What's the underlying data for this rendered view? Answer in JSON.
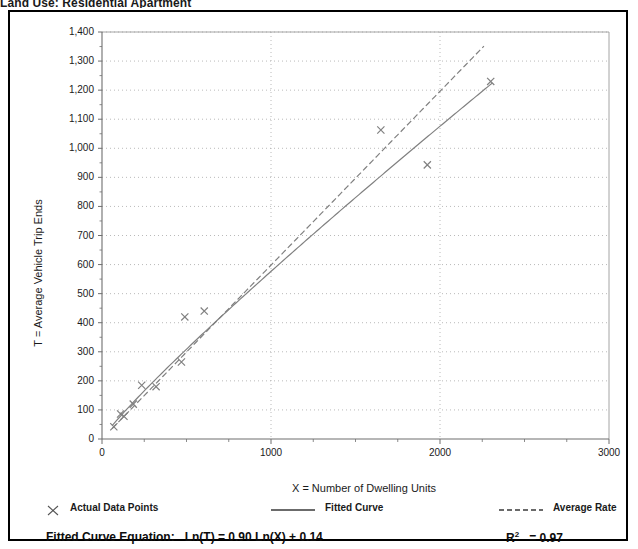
{
  "page": {
    "clipped_title": "Land Use: Residential Apartment"
  },
  "chart_data": {
    "type": "scatter",
    "title": "",
    "xlabel": "X = Number of Dwelling Units",
    "ylabel": "T = Average Vehicle Trip Ends",
    "xlim": [
      0,
      3000
    ],
    "ylim": [
      0,
      1400
    ],
    "xticks": [
      0,
      1000,
      2000,
      3000
    ],
    "xtick_labels": [
      "0",
      "1000",
      "2000",
      "3000"
    ],
    "yticks": [
      0,
      100,
      200,
      300,
      400,
      500,
      600,
      700,
      800,
      900,
      1000,
      1100,
      1200,
      1300,
      1400
    ],
    "ytick_labels": [
      "0",
      "100",
      "200",
      "300",
      "400",
      "500",
      "600",
      "700",
      "800",
      "900",
      "1,000",
      "1,100",
      "1,200",
      "1,300",
      "1,400"
    ],
    "x_minor_tick_interval": 250,
    "grid": "dotted-gray-both-axes",
    "series": [
      {
        "name": "Actual Data Points",
        "type": "scatter",
        "marker": "x",
        "color": "#808080",
        "points": [
          [
            70,
            42
          ],
          [
            110,
            86
          ],
          [
            130,
            78
          ],
          [
            185,
            120
          ],
          [
            235,
            185
          ],
          [
            320,
            180
          ],
          [
            470,
            265
          ],
          [
            490,
            420
          ],
          [
            605,
            440
          ],
          [
            1650,
            1063
          ],
          [
            1925,
            943
          ],
          [
            2300,
            1230
          ]
        ]
      },
      {
        "name": "Fitted Curve",
        "type": "line",
        "style": "solid",
        "color": "#808080",
        "equation": "Ln(T) = 0.90 Ln(X) + 0.14",
        "intercept_b": 0.14,
        "slope_a": 0.9,
        "x_range": [
          60,
          2310
        ]
      },
      {
        "name": "Average Rate",
        "type": "line",
        "style": "dashed",
        "color": "#808080",
        "rate_per_unit": 0.598,
        "x_range": [
          60,
          2260
        ]
      }
    ],
    "legend": {
      "position": "below-axes",
      "entries": [
        {
          "label": "Actual Data Points",
          "key": "x-marker"
        },
        {
          "label": "Fitted Curve",
          "key": "solid-line"
        },
        {
          "label": "Average Rate",
          "key": "dashed-line"
        }
      ]
    },
    "annotations": {
      "equation_label": "Fitted Curve Equation:",
      "equation_value": "Ln(T) = 0.90 Ln(X) + 0.14",
      "r_squared_label": "R",
      "r_squared_sup": "2",
      "r_squared_value": "= 0.97"
    },
    "colors": {
      "frame": "#000000",
      "grid": "#a8a8a8",
      "axis": "#6e6e6e",
      "data": "#808080",
      "text": "#1a1a1a"
    }
  }
}
